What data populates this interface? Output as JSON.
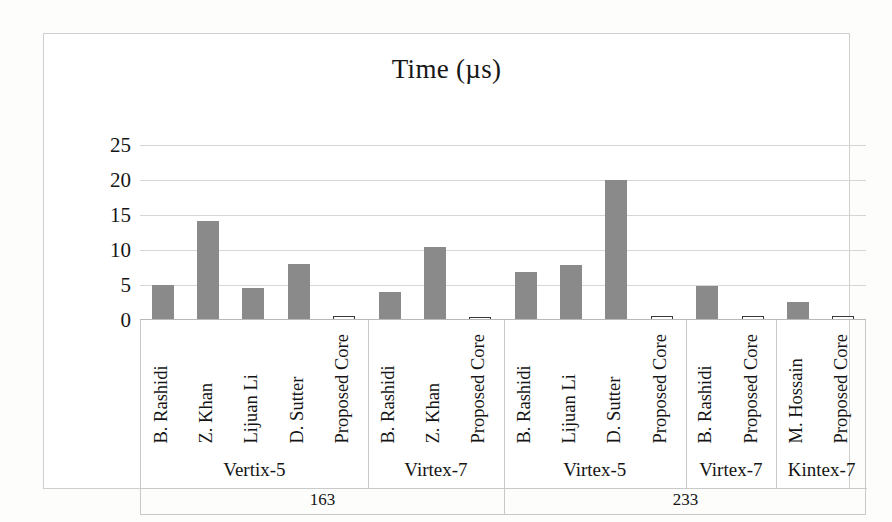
{
  "chart_data": {
    "type": "bar",
    "title": "Time (µs)",
    "xlabel": "",
    "ylabel": "",
    "ylim": [
      0,
      25
    ],
    "yticks": [
      0,
      5,
      10,
      15,
      20,
      25
    ],
    "grid": true,
    "legend": "none",
    "categories": [
      "B. Rashidi",
      "Z. Khan",
      "Lijuan Li",
      "D. Sutter",
      "Proposed Core",
      "B. Rashidi",
      "Z. Khan",
      "Proposed Core",
      "B. Rashidi",
      "Lijuan Li",
      "D. Sutter",
      "Proposed Core",
      "B. Rashidi",
      "Proposed Core",
      "M. Hossain",
      "Proposed Core"
    ],
    "values": [
      5.0,
      14.2,
      4.6,
      8.0,
      0.6,
      4.0,
      10.4,
      0.5,
      6.8,
      7.8,
      20.0,
      0.6,
      4.9,
      0.6,
      2.6,
      0.6
    ],
    "bar_styles": [
      "filled",
      "filled",
      "filled",
      "filled",
      "outlined",
      "filled",
      "filled",
      "outlined",
      "filled",
      "filled",
      "filled",
      "outlined",
      "filled",
      "outlined",
      "filled",
      "outlined"
    ],
    "device_groups": [
      {
        "label": "Vertix-5",
        "count": 5
      },
      {
        "label": "Virtex-7",
        "count": 3
      },
      {
        "label": "Virtex-5",
        "count": 4
      },
      {
        "label": "Virtex-7",
        "count": 2
      },
      {
        "label": "Kintex-7",
        "count": 2
      }
    ],
    "field_groups": [
      {
        "label": "163",
        "count": 8
      },
      {
        "label": "233",
        "count": 8
      }
    ],
    "colors": {
      "bar_fill": "#8a8a8a",
      "bar_outline": "#3a3a3a",
      "gridline": "#d6d6d6",
      "frame": "#c9c9c9",
      "text": "#141414",
      "background": "#ffffff"
    }
  }
}
